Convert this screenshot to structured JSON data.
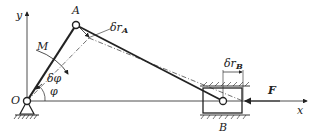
{
  "diagram": {
    "type": "slider-crank mechanism (virtual displacement)",
    "labels": {
      "y_axis": "y",
      "x_axis": "x",
      "origin": "O",
      "point_a": "A",
      "point_b": "B",
      "moment": "M",
      "angle_delta": "δφ",
      "angle": "φ",
      "disp_a": "δr",
      "disp_a_sub": "A",
      "disp_b": "δr",
      "disp_b_sub": "B",
      "force": "F"
    },
    "colors": {
      "line": "#222222",
      "dash": "#333333",
      "background": "#ffffff"
    }
  }
}
